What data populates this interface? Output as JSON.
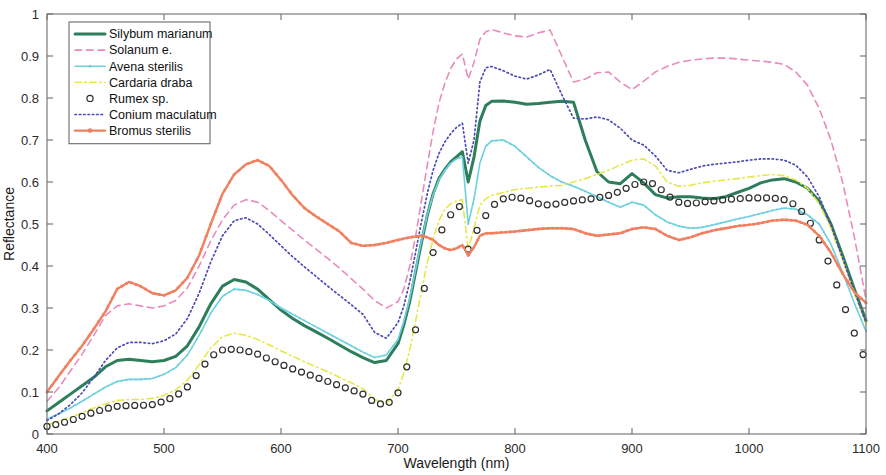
{
  "chart_data": {
    "type": "line",
    "title": "",
    "xlabel": "Wavelength (nm)",
    "ylabel": "Reflectance",
    "xlim": [
      400,
      1100
    ],
    "ylim": [
      0,
      1
    ],
    "xticks": [
      400,
      500,
      600,
      700,
      800,
      900,
      1000,
      1100
    ],
    "xtick_labels": [
      "400",
      "500",
      "600",
      "700",
      "800",
      "900",
      "1000",
      "1100"
    ],
    "yticks": [
      0,
      0.1,
      0.2,
      0.3,
      0.4,
      0.5,
      0.6,
      0.7,
      0.8,
      0.9,
      1
    ],
    "ytick_labels": [
      "0",
      "0.1",
      "0.2",
      "0.3",
      "0.4",
      "0.5",
      "0.6",
      "0.7",
      "0.8",
      "0.9",
      "1"
    ],
    "grid": false,
    "legend_position": "upper-left",
    "x": [
      400,
      410,
      420,
      430,
      440,
      450,
      460,
      470,
      480,
      490,
      500,
      510,
      520,
      530,
      540,
      550,
      560,
      570,
      580,
      590,
      600,
      610,
      620,
      630,
      640,
      650,
      660,
      670,
      680,
      690,
      700,
      705,
      710,
      715,
      720,
      725,
      730,
      735,
      740,
      745,
      750,
      755,
      760,
      765,
      770,
      775,
      780,
      790,
      800,
      810,
      820,
      830,
      840,
      850,
      860,
      870,
      880,
      890,
      900,
      910,
      920,
      930,
      940,
      950,
      960,
      970,
      980,
      990,
      1000,
      1010,
      1020,
      1030,
      1040,
      1050,
      1060,
      1070,
      1080,
      1090,
      1100
    ],
    "series": [
      {
        "name": "Silybum marianum",
        "color": "#2e7d5b",
        "style": "solid",
        "width": 3.0,
        "marker": "none",
        "values": [
          0.055,
          0.075,
          0.095,
          0.115,
          0.135,
          0.16,
          0.175,
          0.178,
          0.175,
          0.172,
          0.175,
          0.185,
          0.21,
          0.255,
          0.31,
          0.352,
          0.368,
          0.362,
          0.345,
          0.32,
          0.295,
          0.275,
          0.258,
          0.243,
          0.228,
          0.212,
          0.196,
          0.182,
          0.17,
          0.175,
          0.215,
          0.26,
          0.315,
          0.385,
          0.455,
          0.52,
          0.572,
          0.608,
          0.63,
          0.648,
          0.66,
          0.672,
          0.6,
          0.66,
          0.745,
          0.782,
          0.792,
          0.793,
          0.79,
          0.785,
          0.787,
          0.79,
          0.792,
          0.79,
          0.7,
          0.625,
          0.6,
          0.596,
          0.62,
          0.598,
          0.57,
          0.562,
          0.565,
          0.565,
          0.562,
          0.56,
          0.565,
          0.575,
          0.585,
          0.598,
          0.605,
          0.608,
          0.6,
          0.585,
          0.555,
          0.5,
          0.425,
          0.345,
          0.27
        ]
      },
      {
        "name": "Solanum e.",
        "color": "#e88bbd",
        "style": "dashed",
        "width": 1.6,
        "marker": "none",
        "values": [
          0.078,
          0.11,
          0.15,
          0.19,
          0.235,
          0.282,
          0.305,
          0.31,
          0.305,
          0.3,
          0.305,
          0.318,
          0.348,
          0.4,
          0.46,
          0.51,
          0.545,
          0.558,
          0.552,
          0.532,
          0.508,
          0.485,
          0.462,
          0.44,
          0.418,
          0.395,
          0.37,
          0.345,
          0.318,
          0.3,
          0.315,
          0.345,
          0.4,
          0.47,
          0.555,
          0.64,
          0.72,
          0.788,
          0.835,
          0.87,
          0.893,
          0.905,
          0.845,
          0.885,
          0.94,
          0.958,
          0.963,
          0.955,
          0.948,
          0.945,
          0.955,
          0.962,
          0.9,
          0.838,
          0.845,
          0.86,
          0.862,
          0.838,
          0.82,
          0.84,
          0.862,
          0.875,
          0.885,
          0.89,
          0.893,
          0.895,
          0.895,
          0.893,
          0.89,
          0.888,
          0.885,
          0.88,
          0.862,
          0.83,
          0.775,
          0.7,
          0.6,
          0.47,
          0.32
        ]
      },
      {
        "name": "Avena sterilis",
        "color": "#6fd0de",
        "style": "solid",
        "width": 1.6,
        "marker": "dot",
        "values": [
          0.035,
          0.048,
          0.062,
          0.078,
          0.095,
          0.112,
          0.125,
          0.13,
          0.13,
          0.132,
          0.142,
          0.158,
          0.188,
          0.235,
          0.288,
          0.328,
          0.345,
          0.342,
          0.332,
          0.318,
          0.3,
          0.285,
          0.27,
          0.255,
          0.24,
          0.225,
          0.21,
          0.195,
          0.182,
          0.188,
          0.225,
          0.268,
          0.322,
          0.39,
          0.46,
          0.522,
          0.57,
          0.605,
          0.628,
          0.645,
          0.655,
          0.66,
          0.5,
          0.56,
          0.645,
          0.685,
          0.698,
          0.7,
          0.685,
          0.66,
          0.635,
          0.615,
          0.6,
          0.59,
          0.578,
          0.565,
          0.552,
          0.54,
          0.552,
          0.545,
          0.522,
          0.505,
          0.495,
          0.49,
          0.492,
          0.498,
          0.505,
          0.512,
          0.518,
          0.525,
          0.532,
          0.538,
          0.535,
          0.522,
          0.5,
          0.452,
          0.385,
          0.312,
          0.245
        ]
      },
      {
        "name": "Cardaria draba",
        "color": "#e5e84a",
        "style": "dashdot",
        "width": 1.6,
        "marker": "none",
        "values": [
          0.022,
          0.03,
          0.04,
          0.05,
          0.062,
          0.072,
          0.08,
          0.082,
          0.082,
          0.085,
          0.092,
          0.105,
          0.128,
          0.165,
          0.205,
          0.232,
          0.24,
          0.235,
          0.225,
          0.212,
          0.198,
          0.185,
          0.172,
          0.16,
          0.148,
          0.135,
          0.122,
          0.108,
          0.082,
          0.072,
          0.105,
          0.145,
          0.2,
          0.268,
          0.34,
          0.408,
          0.465,
          0.508,
          0.535,
          0.548,
          0.555,
          0.558,
          0.44,
          0.49,
          0.545,
          0.56,
          0.568,
          0.575,
          0.582,
          0.585,
          0.588,
          0.59,
          0.592,
          0.6,
          0.608,
          0.618,
          0.628,
          0.64,
          0.652,
          0.655,
          0.638,
          0.6,
          0.59,
          0.592,
          0.598,
          0.602,
          0.605,
          0.608,
          0.612,
          0.615,
          0.618,
          0.615,
          0.605,
          0.585,
          0.548,
          0.49,
          0.415,
          0.335,
          0.262
        ]
      },
      {
        "name": "Rumex sp.",
        "color": "#2f2f2f",
        "style": "none",
        "width": 1.0,
        "marker": "circle",
        "values": [
          0.018,
          0.024,
          0.032,
          0.042,
          0.052,
          0.06,
          0.066,
          0.068,
          0.068,
          0.07,
          0.078,
          0.09,
          0.112,
          0.148,
          0.185,
          0.2,
          0.202,
          0.198,
          0.19,
          0.178,
          0.166,
          0.155,
          0.145,
          0.135,
          0.125,
          0.115,
          0.105,
          0.095,
          0.075,
          0.068,
          0.098,
          0.135,
          0.185,
          0.248,
          0.315,
          0.378,
          0.432,
          0.472,
          0.5,
          0.522,
          0.535,
          0.548,
          0.44,
          0.47,
          0.5,
          0.52,
          0.542,
          0.56,
          0.565,
          0.558,
          0.548,
          0.545,
          0.55,
          0.555,
          0.558,
          0.562,
          0.568,
          0.578,
          0.592,
          0.6,
          0.595,
          0.568,
          0.552,
          0.548,
          0.552,
          0.555,
          0.558,
          0.56,
          0.562,
          0.562,
          0.562,
          0.558,
          0.545,
          0.515,
          0.462,
          0.395,
          0.315,
          0.24,
          0.172
        ]
      },
      {
        "name": "Conium maculatum",
        "color": "#4a4ab5",
        "style": "dotted",
        "width": 1.7,
        "marker": "none",
        "values": [
          0.032,
          0.048,
          0.07,
          0.098,
          0.135,
          0.175,
          0.205,
          0.218,
          0.218,
          0.215,
          0.222,
          0.238,
          0.275,
          0.335,
          0.41,
          0.472,
          0.508,
          0.515,
          0.5,
          0.475,
          0.448,
          0.422,
          0.398,
          0.375,
          0.352,
          0.33,
          0.308,
          0.285,
          0.242,
          0.228,
          0.265,
          0.305,
          0.362,
          0.432,
          0.505,
          0.572,
          0.628,
          0.668,
          0.695,
          0.715,
          0.73,
          0.74,
          0.645,
          0.7,
          0.838,
          0.872,
          0.875,
          0.865,
          0.852,
          0.845,
          0.855,
          0.868,
          0.808,
          0.752,
          0.75,
          0.755,
          0.748,
          0.728,
          0.7,
          0.688,
          0.662,
          0.628,
          0.622,
          0.63,
          0.638,
          0.642,
          0.645,
          0.648,
          0.652,
          0.655,
          0.655,
          0.652,
          0.64,
          0.612,
          0.565,
          0.498,
          0.418,
          0.34,
          0.265
        ]
      },
      {
        "name": "Bromus sterilis",
        "color": "#f08060",
        "style": "solid",
        "width": 2.4,
        "marker": "dot",
        "values": [
          0.1,
          0.138,
          0.175,
          0.21,
          0.25,
          0.292,
          0.345,
          0.362,
          0.352,
          0.335,
          0.33,
          0.342,
          0.372,
          0.425,
          0.5,
          0.572,
          0.618,
          0.642,
          0.652,
          0.638,
          0.605,
          0.568,
          0.538,
          0.518,
          0.5,
          0.482,
          0.455,
          0.448,
          0.45,
          0.455,
          0.462,
          0.465,
          0.468,
          0.47,
          0.472,
          0.468,
          0.462,
          0.45,
          0.442,
          0.438,
          0.442,
          0.45,
          0.425,
          0.445,
          0.472,
          0.478,
          0.478,
          0.48,
          0.482,
          0.485,
          0.488,
          0.49,
          0.49,
          0.488,
          0.478,
          0.472,
          0.475,
          0.478,
          0.488,
          0.492,
          0.488,
          0.472,
          0.462,
          0.468,
          0.478,
          0.485,
          0.49,
          0.495,
          0.498,
          0.502,
          0.508,
          0.51,
          0.508,
          0.498,
          0.472,
          0.432,
          0.382,
          0.338,
          0.312
        ]
      }
    ],
    "legend_entries": [
      {
        "label": "Silybum marianum"
      },
      {
        "label": "Solanum e."
      },
      {
        "label": "Avena sterilis"
      },
      {
        "label": "Cardaria draba"
      },
      {
        "label": "Rumex sp."
      },
      {
        "label": "Conium maculatum"
      },
      {
        "label": "Bromus sterilis"
      }
    ]
  }
}
